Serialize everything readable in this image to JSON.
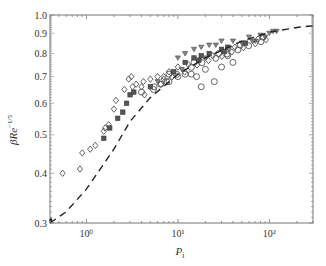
{
  "chart_data": {
    "type": "scatter",
    "title": "",
    "xlabel": "P_i",
    "ylabel": "βRe^{-1/5}",
    "xscale": "log",
    "yscale": "log",
    "xlim": [
      0.4,
      300
    ],
    "ylim": [
      0.3,
      1.0
    ],
    "x_ticks": [
      {
        "value": 1,
        "label": "10⁰"
      },
      {
        "value": 10,
        "label": "10¹"
      },
      {
        "value": 100,
        "label": "10²"
      }
    ],
    "y_ticks": [
      {
        "value": 0.3,
        "label": "0.3"
      },
      {
        "value": 0.4,
        "label": "0.4"
      },
      {
        "value": 0.5,
        "label": "0.5"
      },
      {
        "value": 0.6,
        "label": "0.6"
      },
      {
        "value": 0.7,
        "label": "0.7"
      },
      {
        "value": 0.8,
        "label": "0.8"
      },
      {
        "value": 0.9,
        "label": "0.9"
      },
      {
        "value": 1.0,
        "label": "1.0"
      }
    ],
    "grid": false,
    "legend": null,
    "series": [
      {
        "name": "open diamonds",
        "marker": "diamond-open",
        "points": [
          [
            0.55,
            0.4
          ],
          [
            0.85,
            0.41
          ],
          [
            0.9,
            0.45
          ],
          [
            1.1,
            0.46
          ],
          [
            1.25,
            0.47
          ],
          [
            1.55,
            0.51
          ],
          [
            1.6,
            0.52
          ],
          [
            1.75,
            0.53
          ],
          [
            2.1,
            0.61
          ],
          [
            2.0,
            0.58
          ],
          [
            2.6,
            0.65
          ],
          [
            3.2,
            0.66
          ],
          [
            3.5,
            0.67
          ],
          [
            4.0,
            0.66
          ],
          [
            4.2,
            0.68
          ],
          [
            5.0,
            0.69
          ],
          [
            6.0,
            0.7
          ],
          [
            7.0,
            0.7
          ],
          [
            8.0,
            0.72
          ],
          [
            10.0,
            0.74
          ],
          [
            3.1,
            0.7
          ],
          [
            2.9,
            0.69
          ]
        ]
      },
      {
        "name": "filled squares",
        "marker": "square-filled",
        "points": [
          [
            1.55,
            0.49
          ],
          [
            1.8,
            0.52
          ],
          [
            2.2,
            0.55
          ],
          [
            2.5,
            0.57
          ],
          [
            2.75,
            0.6
          ],
          [
            3.0,
            0.63
          ],
          [
            3.3,
            0.64
          ],
          [
            12.0,
            0.76
          ],
          [
            15.0,
            0.78
          ],
          [
            18.0,
            0.79
          ],
          [
            22.0,
            0.8
          ],
          [
            30.0,
            0.82
          ],
          [
            35.0,
            0.83
          ]
        ]
      },
      {
        "name": "open circles",
        "marker": "circle-open",
        "points": [
          [
            5.5,
            0.66
          ],
          [
            6.5,
            0.67
          ],
          [
            8.0,
            0.68
          ],
          [
            10.0,
            0.7
          ],
          [
            12.0,
            0.71
          ],
          [
            14.0,
            0.71
          ],
          [
            16.0,
            0.7
          ],
          [
            20.0,
            0.73
          ],
          [
            25.0,
            0.68
          ],
          [
            30.0,
            0.74
          ],
          [
            35.0,
            0.79
          ],
          [
            40.0,
            0.76
          ],
          [
            18.0,
            0.66
          ]
        ]
      },
      {
        "name": "open triangles down",
        "marker": "triangle-down-open",
        "points": [
          [
            10.0,
            0.78
          ],
          [
            12.0,
            0.8
          ],
          [
            15.0,
            0.82
          ],
          [
            18.0,
            0.83
          ],
          [
            22.0,
            0.84
          ],
          [
            26.0,
            0.84
          ],
          [
            30.0,
            0.86
          ],
          [
            40.0,
            0.86
          ],
          [
            50.0,
            0.85
          ],
          [
            60.0,
            0.88
          ],
          [
            70.0,
            0.86
          ],
          [
            80.0,
            0.89
          ],
          [
            90.0,
            0.88
          ],
          [
            100.0,
            0.9
          ],
          [
            110.0,
            0.91
          ],
          [
            120.0,
            0.91
          ]
        ]
      },
      {
        "name": "mixed dense cloud",
        "marker": "mixed",
        "points": [
          [
            4.0,
            0.64
          ],
          [
            5.0,
            0.66
          ],
          [
            6.0,
            0.68
          ],
          [
            7.0,
            0.69
          ],
          [
            8.0,
            0.71
          ],
          [
            9.0,
            0.72
          ],
          [
            11.0,
            0.73
          ],
          [
            13.0,
            0.75
          ],
          [
            15.0,
            0.76
          ],
          [
            17.0,
            0.77
          ],
          [
            20.0,
            0.78
          ],
          [
            24.0,
            0.79
          ],
          [
            28.0,
            0.8
          ],
          [
            32.0,
            0.81
          ],
          [
            36.0,
            0.82
          ],
          [
            42.0,
            0.83
          ],
          [
            48.0,
            0.84
          ],
          [
            55.0,
            0.85
          ],
          [
            65.0,
            0.86
          ],
          [
            75.0,
            0.87
          ],
          [
            85.0,
            0.88
          ]
        ]
      }
    ],
    "fit_curve": {
      "name": "fit",
      "style": "dashed",
      "x": [
        0.4,
        0.6,
        1.0,
        2.0,
        3.0,
        5.0,
        10.0,
        20.0,
        50.0,
        100.0,
        200.0,
        300.0
      ],
      "y": [
        0.3,
        0.32,
        0.365,
        0.46,
        0.54,
        0.62,
        0.71,
        0.78,
        0.86,
        0.905,
        0.93,
        0.94
      ]
    }
  }
}
